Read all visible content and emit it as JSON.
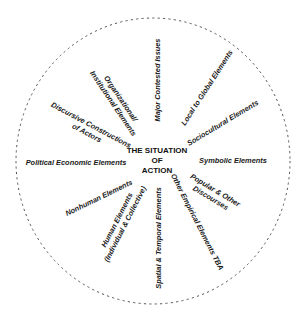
{
  "diagram": {
    "type": "situational-map",
    "center": {
      "lines": [
        "THE SITUATION",
        "OF",
        "ACTION"
      ]
    },
    "boundary": {
      "style": "dashed-ellipse",
      "color": "#555555"
    },
    "elements": [
      {
        "id": "major-contested-issues",
        "lines": [
          "Major Contested Issues"
        ]
      },
      {
        "id": "local-to-global",
        "lines": [
          "Local to Global Elements"
        ]
      },
      {
        "id": "sociocultural",
        "lines": [
          "Sociocultural Elements"
        ]
      },
      {
        "id": "symbolic",
        "lines": [
          "Symbolic Elements"
        ]
      },
      {
        "id": "popular-other-discourses",
        "lines": [
          "Popular & Other",
          "Discourses"
        ]
      },
      {
        "id": "other-empirical",
        "lines": [
          "Other Empirical Elements TBA"
        ]
      },
      {
        "id": "spatial-temporal",
        "lines": [
          "Spatial & Temporal Elements"
        ]
      },
      {
        "id": "human-elements",
        "lines": [
          "Human Elements",
          "(Individual & Collective)"
        ]
      },
      {
        "id": "nonhuman",
        "lines": [
          "Nonhuman Elements"
        ]
      },
      {
        "id": "political-economic",
        "lines": [
          "Political Economic Elements"
        ]
      },
      {
        "id": "discursive-constructions",
        "lines": [
          "Discursive Constructions",
          "of Actors"
        ]
      },
      {
        "id": "organizational-institutional",
        "lines": [
          "Organizational/",
          "Institutional Elements"
        ]
      }
    ]
  }
}
